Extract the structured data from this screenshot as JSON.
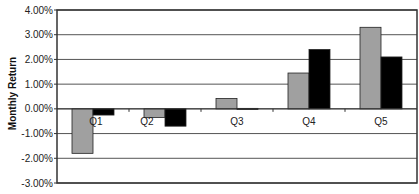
{
  "chart_data": {
    "type": "bar",
    "title": "",
    "xlabel": "",
    "ylabel": "Monthly Return",
    "categories": [
      "Q1",
      "Q2",
      "Q3",
      "Q4",
      "Q5"
    ],
    "series": [
      {
        "name": "Series 1",
        "color": "#a0a0a0",
        "values": [
          -1.8,
          -0.35,
          0.42,
          1.45,
          3.3
        ]
      },
      {
        "name": "Series 2",
        "color": "#000000",
        "values": [
          -0.25,
          -0.7,
          0.02,
          2.4,
          2.1
        ]
      }
    ],
    "ylim": [
      -3.0,
      4.0
    ],
    "yticks": [
      "4.00%",
      "3.00%",
      "2.00%",
      "1.00%",
      "0.00%",
      "-1.00%",
      "-2.00%",
      "-3.00%"
    ],
    "grid": true,
    "legend": "none",
    "note": "x-axis title cropped at bottom edge, unreadable"
  },
  "labels": {
    "ylabel": "Monthly Return"
  }
}
